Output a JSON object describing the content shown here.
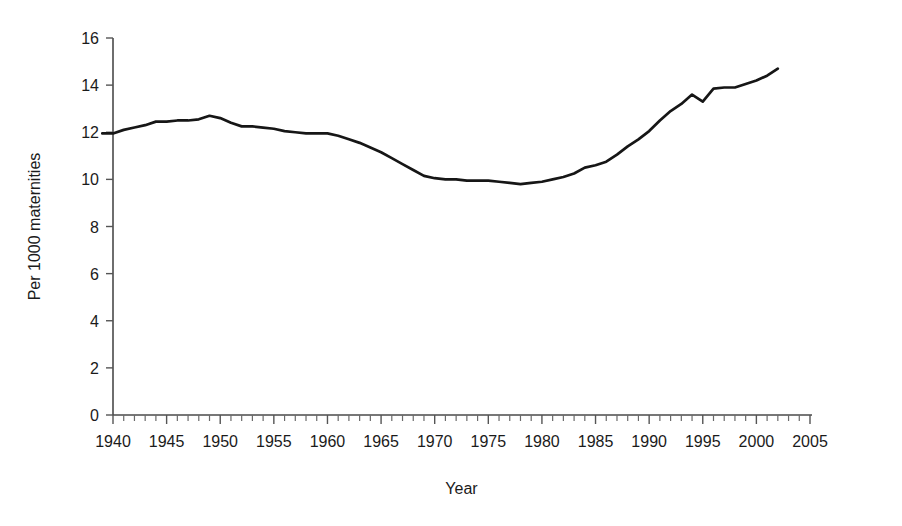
{
  "chart_data": {
    "type": "line",
    "title": "",
    "xlabel": "Year",
    "ylabel": "Per 1000 maternities",
    "xlim": [
      1939,
      2005
    ],
    "ylim": [
      0,
      16
    ],
    "xtick_labels": [
      "1940",
      "1945",
      "1950",
      "1955",
      "1960",
      "1965",
      "1970",
      "1975",
      "1980",
      "1985",
      "1990",
      "1995",
      "2000",
      "2005"
    ],
    "xticks": [
      1940,
      1945,
      1950,
      1955,
      1960,
      1965,
      1970,
      1975,
      1980,
      1985,
      1990,
      1995,
      2000,
      2005
    ],
    "xtick_minor_step": 1,
    "ytick_labels": [
      "0",
      "2",
      "4",
      "6",
      "8",
      "10",
      "12",
      "14",
      "16"
    ],
    "yticks": [
      0,
      2,
      4,
      6,
      8,
      10,
      12,
      14,
      16
    ],
    "grid": false,
    "legend": false,
    "legend_position": "none",
    "line_color": "#161616",
    "series": [
      {
        "name": "Per 1000 maternities",
        "x": [
          1939,
          1940,
          1941,
          1942,
          1943,
          1944,
          1945,
          1946,
          1947,
          1948,
          1949,
          1950,
          1951,
          1952,
          1953,
          1954,
          1955,
          1956,
          1957,
          1958,
          1959,
          1960,
          1961,
          1962,
          1963,
          1964,
          1965,
          1966,
          1967,
          1968,
          1969,
          1970,
          1971,
          1972,
          1973,
          1974,
          1975,
          1976,
          1977,
          1978,
          1979,
          1980,
          1981,
          1982,
          1983,
          1984,
          1985,
          1986,
          1987,
          1988,
          1989,
          1990,
          1991,
          1992,
          1993,
          1994,
          1995,
          1996,
          1997,
          1998,
          1999,
          2000,
          2001,
          2002
        ],
        "y": [
          11.95,
          11.95,
          12.1,
          12.2,
          12.3,
          12.45,
          12.45,
          12.5,
          12.5,
          12.55,
          12.7,
          12.6,
          12.4,
          12.25,
          12.25,
          12.2,
          12.15,
          12.05,
          12.0,
          11.95,
          11.95,
          11.95,
          11.85,
          11.7,
          11.55,
          11.35,
          11.15,
          10.9,
          10.65,
          10.4,
          10.15,
          10.05,
          10.0,
          10.0,
          9.95,
          9.95,
          9.95,
          9.9,
          9.85,
          9.8,
          9.85,
          9.9,
          10.0,
          10.1,
          10.25,
          10.5,
          10.6,
          10.75,
          11.05,
          11.4,
          11.7,
          12.05,
          12.5,
          12.9,
          13.2,
          13.6,
          13.3,
          13.85,
          13.9,
          13.9,
          14.05,
          14.2,
          14.4,
          14.7
        ]
      }
    ]
  }
}
